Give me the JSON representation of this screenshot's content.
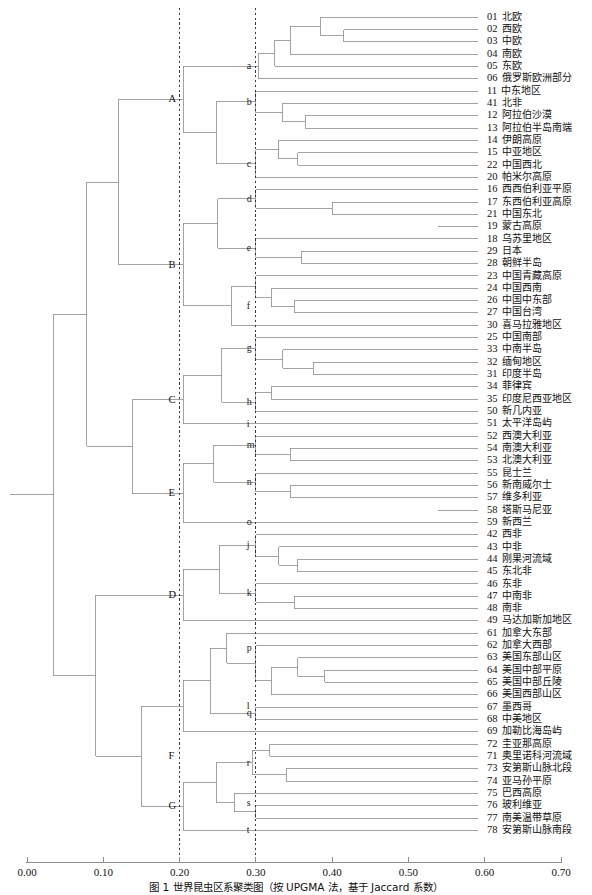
{
  "figure": {
    "caption": "图 1  世界昆虫区系聚类图（按 UPGMA 法，基于 Jaccard 系数）",
    "axis": {
      "label": "",
      "ticks": [
        "0.00",
        "0.10",
        "0.20",
        "0.30",
        "0.40",
        "0.50",
        "0.60",
        "0.70"
      ],
      "tick_values": [
        0.0,
        0.1,
        0.2,
        0.3,
        0.4,
        0.5,
        0.6,
        0.7
      ],
      "range": [
        0.0,
        0.7
      ],
      "reference_lines": [
        0.2,
        0.3
      ],
      "reference_line_style": "dashed"
    },
    "colors": {
      "line": "#8c8c8c",
      "text": "#111111",
      "axis": "#8c8c8c",
      "reference": "#222222",
      "background": "#ffffff"
    }
  },
  "chart_data": {
    "type": "dendrogram",
    "title": "世界昆虫区系聚类图",
    "xlabel": "",
    "ylabel": "",
    "xlim": [
      0.0,
      0.7
    ],
    "grid": false,
    "orientation": "horizontal-right-leaves",
    "leaves": [
      {
        "code": "01",
        "name": "北欧"
      },
      {
        "code": "02",
        "name": "西欧"
      },
      {
        "code": "03",
        "name": "中欧"
      },
      {
        "code": "04",
        "name": "南欧"
      },
      {
        "code": "05",
        "name": "东欧"
      },
      {
        "code": "06",
        "name": "俄罗斯欧洲部分"
      },
      {
        "code": "11",
        "name": "中东地区"
      },
      {
        "code": "41",
        "name": "北非"
      },
      {
        "code": "12",
        "name": "阿拉伯沙漠"
      },
      {
        "code": "13",
        "name": "阿拉伯半岛南端"
      },
      {
        "code": "14",
        "name": "伊朗高原"
      },
      {
        "code": "15",
        "name": "中亚地区"
      },
      {
        "code": "22",
        "name": "中国西北"
      },
      {
        "code": "20",
        "name": "帕米尔高原"
      },
      {
        "code": "16",
        "name": "西西伯利亚平原"
      },
      {
        "code": "17",
        "name": "东西伯利亚高原"
      },
      {
        "code": "21",
        "name": "中国东北"
      },
      {
        "code": "19",
        "name": "蒙古高原"
      },
      {
        "code": "18",
        "name": "乌苏里地区"
      },
      {
        "code": "29",
        "name": "日本"
      },
      {
        "code": "28",
        "name": "朝鲜半岛"
      },
      {
        "code": "23",
        "name": "中国青藏高原"
      },
      {
        "code": "24",
        "name": "中国西南"
      },
      {
        "code": "26",
        "name": "中国中东部"
      },
      {
        "code": "27",
        "name": "中国台湾"
      },
      {
        "code": "30",
        "name": "喜马拉雅地区"
      },
      {
        "code": "25",
        "name": "中国南部"
      },
      {
        "code": "33",
        "name": "中南半岛"
      },
      {
        "code": "32",
        "name": "缅甸地区"
      },
      {
        "code": "31",
        "name": "印度半岛"
      },
      {
        "code": "34",
        "name": "菲律宾"
      },
      {
        "code": "35",
        "name": "印度尼西亚地区"
      },
      {
        "code": "50",
        "name": "新几内亚"
      },
      {
        "code": "51",
        "name": "太平洋岛屿"
      },
      {
        "code": "52",
        "name": "西澳大利亚"
      },
      {
        "code": "54",
        "name": "南澳大利亚"
      },
      {
        "code": "53",
        "name": "北澳大利亚"
      },
      {
        "code": "55",
        "name": "昆士兰"
      },
      {
        "code": "56",
        "name": "新南威尔士"
      },
      {
        "code": "57",
        "name": "维多利亚"
      },
      {
        "code": "58",
        "name": "塔斯马尼亚"
      },
      {
        "code": "59",
        "name": "新西兰"
      },
      {
        "code": "42",
        "name": "西非"
      },
      {
        "code": "43",
        "name": "中非"
      },
      {
        "code": "44",
        "name": "刚果河流域"
      },
      {
        "code": "45",
        "name": "东北非"
      },
      {
        "code": "46",
        "name": "东非"
      },
      {
        "code": "47",
        "name": "中南非"
      },
      {
        "code": "48",
        "name": "南非"
      },
      {
        "code": "49",
        "name": "马达加斯加地区"
      },
      {
        "code": "61",
        "name": "加拿大东部"
      },
      {
        "code": "62",
        "name": "加拿大西部"
      },
      {
        "code": "63",
        "name": "美国东部山区"
      },
      {
        "code": "64",
        "name": "美国中部平原"
      },
      {
        "code": "65",
        "name": "美国中部丘陵"
      },
      {
        "code": "66",
        "name": "美国西部山区"
      },
      {
        "code": "67",
        "name": "墨西哥"
      },
      {
        "code": "68",
        "name": "中美地区"
      },
      {
        "code": "69",
        "name": "加勒比海岛屿"
      },
      {
        "code": "72",
        "name": "圭亚那高原"
      },
      {
        "code": "71",
        "name": "奥里诺科河流域"
      },
      {
        "code": "73",
        "name": "安第斯山脉北段"
      },
      {
        "code": "74",
        "name": "亚马孙平原"
      },
      {
        "code": "75",
        "name": "巴西高原"
      },
      {
        "code": "76",
        "name": "玻利维亚"
      },
      {
        "code": "77",
        "name": "南美温带草原"
      },
      {
        "code": "78",
        "name": "安第斯山脉南段"
      }
    ],
    "cluster_labels": [
      {
        "id": "A",
        "x": 0.2,
        "leaf_from": 0,
        "leaf_to": 13
      },
      {
        "id": "B",
        "x": 0.2,
        "leaf_from": 14,
        "leaf_to": 25
      },
      {
        "id": "C",
        "x": 0.2,
        "leaf_from": 26,
        "leaf_to": 33
      },
      {
        "id": "E",
        "x": 0.2,
        "leaf_from": 34,
        "leaf_to": 41
      },
      {
        "id": "D",
        "x": 0.2,
        "leaf_from": 42,
        "leaf_to": 49
      },
      {
        "id": "F",
        "x": 0.2,
        "leaf_from": 50,
        "leaf_to": 58
      },
      {
        "id": "G",
        "x": 0.2,
        "leaf_from": 59,
        "leaf_to": 66
      }
    ],
    "sub_labels": [
      {
        "id": "a",
        "x": 0.3
      },
      {
        "id": "b",
        "x": 0.3
      },
      {
        "id": "c",
        "x": 0.3
      },
      {
        "id": "d",
        "x": 0.3
      },
      {
        "id": "e",
        "x": 0.3
      },
      {
        "id": "f",
        "x": 0.3
      },
      {
        "id": "g",
        "x": 0.3
      },
      {
        "id": "h",
        "x": 0.3
      },
      {
        "id": "i",
        "x": 0.3
      },
      {
        "id": "m",
        "x": 0.3
      },
      {
        "id": "n",
        "x": 0.3
      },
      {
        "id": "o",
        "x": 0.3
      },
      {
        "id": "j",
        "x": 0.3
      },
      {
        "id": "k",
        "x": 0.3
      },
      {
        "id": "l",
        "x": 0.3
      },
      {
        "id": "p",
        "x": 0.3
      },
      {
        "id": "q",
        "x": 0.3
      },
      {
        "id": "r",
        "x": 0.3
      },
      {
        "id": "s",
        "x": 0.3
      },
      {
        "id": "t",
        "x": 0.3
      }
    ],
    "merges": [
      {
        "id": "m02_03",
        "children": [
          "leaf:02",
          "leaf:03"
        ],
        "height": 0.415
      },
      {
        "id": "m01_x",
        "children": [
          "leaf:01",
          "m02_03"
        ],
        "height": 0.385
      },
      {
        "id": "m04_x",
        "children": [
          "leaf:04",
          "m01_x"
        ],
        "height": 0.345
      },
      {
        "id": "m05_x",
        "children": [
          "leaf:05",
          "m04_x"
        ],
        "height": 0.325
      },
      {
        "id": "ma",
        "children": [
          "leaf:06",
          "m05_x"
        ],
        "height": 0.303
      },
      {
        "id": "m12_13",
        "children": [
          "leaf:12",
          "leaf:13"
        ],
        "height": 0.365
      },
      {
        "id": "m41_x",
        "children": [
          "leaf:41",
          "m12_13"
        ],
        "height": 0.335
      },
      {
        "id": "mb",
        "children": [
          "leaf:11",
          "m41_x"
        ],
        "height": 0.3
      },
      {
        "id": "m15_22",
        "children": [
          "leaf:15",
          "leaf:22"
        ],
        "height": 0.355
      },
      {
        "id": "m14_x",
        "children": [
          "leaf:14",
          "m15_22"
        ],
        "height": 0.33
      },
      {
        "id": "mc",
        "children": [
          "m14_x",
          "leaf:20"
        ],
        "height": 0.3
      },
      {
        "id": "mbc",
        "children": [
          "mb",
          "mc"
        ],
        "height": 0.248
      },
      {
        "id": "mA",
        "children": [
          "ma",
          "mbc"
        ],
        "height": 0.205
      },
      {
        "id": "m17_21",
        "children": [
          "leaf:17",
          "leaf:21"
        ],
        "height": 0.4
      },
      {
        "id": "md",
        "children": [
          "leaf:16",
          "m17_21"
        ],
        "height": 0.3
      },
      {
        "id": "m29_28",
        "children": [
          "leaf:29",
          "leaf:28"
        ],
        "height": 0.36
      },
      {
        "id": "me",
        "children": [
          "leaf:18",
          "m29_28"
        ],
        "height": 0.3
      },
      {
        "id": "mde",
        "children": [
          "md",
          "me"
        ],
        "height": 0.25
      },
      {
        "id": "m26_27",
        "children": [
          "leaf:26",
          "leaf:27"
        ],
        "height": 0.35
      },
      {
        "id": "m24_x",
        "children": [
          "leaf:24",
          "m26_27"
        ],
        "height": 0.32
      },
      {
        "id": "m23_x",
        "children": [
          "leaf:23",
          "m24_x"
        ],
        "height": 0.3
      },
      {
        "id": "mf",
        "children": [
          "m23_x",
          "leaf:30"
        ],
        "height": 0.268
      },
      {
        "id": "mB",
        "children": [
          "mde",
          "mf"
        ],
        "height": 0.205
      },
      {
        "id": "m32_31",
        "children": [
          "leaf:32",
          "leaf:31"
        ],
        "height": 0.375
      },
      {
        "id": "m33_x",
        "children": [
          "leaf:33",
          "m32_31"
        ],
        "height": 0.335
      },
      {
        "id": "mg",
        "children": [
          "leaf:25",
          "m33_x"
        ],
        "height": 0.3
      },
      {
        "id": "m34_35",
        "children": [
          "leaf:34",
          "leaf:35"
        ],
        "height": 0.32
      },
      {
        "id": "mh",
        "children": [
          "m34_35",
          "leaf:50"
        ],
        "height": 0.3
      },
      {
        "id": "mgh",
        "children": [
          "mg",
          "mh"
        ],
        "height": 0.255
      },
      {
        "id": "mC",
        "children": [
          "mgh",
          "leaf:51"
        ],
        "height": 0.205
      },
      {
        "id": "m54_53",
        "children": [
          "leaf:54",
          "leaf:53"
        ],
        "height": 0.345
      },
      {
        "id": "mm",
        "children": [
          "leaf:52",
          "m54_53"
        ],
        "height": 0.3
      },
      {
        "id": "m56_57",
        "children": [
          "leaf:56",
          "leaf:57"
        ],
        "height": 0.345
      },
      {
        "id": "mn",
        "children": [
          "leaf:55",
          "m56_57"
        ],
        "height": 0.3
      },
      {
        "id": "mmn",
        "children": [
          "mm",
          "mn"
        ],
        "height": 0.245
      },
      {
        "id": "mE",
        "children": [
          "mmn",
          "leaf:59"
        ],
        "height": 0.205
      },
      {
        "id": "m44_45",
        "children": [
          "leaf:44",
          "leaf:45"
        ],
        "height": 0.355
      },
      {
        "id": "m43_x",
        "children": [
          "leaf:43",
          "m44_45"
        ],
        "height": 0.33
      },
      {
        "id": "mj",
        "children": [
          "leaf:42",
          "m43_x"
        ],
        "height": 0.3
      },
      {
        "id": "m47_48",
        "children": [
          "leaf:47",
          "leaf:48"
        ],
        "height": 0.35
      },
      {
        "id": "mk",
        "children": [
          "leaf:46",
          "m47_48"
        ],
        "height": 0.3
      },
      {
        "id": "mjk",
        "children": [
          "mj",
          "mk"
        ],
        "height": 0.252
      },
      {
        "id": "mD",
        "children": [
          "mjk",
          "leaf:49"
        ],
        "height": 0.205
      },
      {
        "id": "m64_65",
        "children": [
          "leaf:64",
          "leaf:65"
        ],
        "height": 0.39
      },
      {
        "id": "m63_x",
        "children": [
          "leaf:63",
          "m64_65"
        ],
        "height": 0.355
      },
      {
        "id": "m66_x",
        "children": [
          "m63_x",
          "leaf:66"
        ],
        "height": 0.32
      },
      {
        "id": "m62_x",
        "children": [
          "leaf:62",
          "m66_x"
        ],
        "height": 0.3
      },
      {
        "id": "mp",
        "children": [
          "leaf:61",
          "m62_x"
        ],
        "height": 0.262
      },
      {
        "id": "mq",
        "children": [
          "leaf:67",
          "leaf:68"
        ],
        "height": 0.3
      },
      {
        "id": "mpq",
        "children": [
          "mp",
          "mq"
        ],
        "height": 0.24
      },
      {
        "id": "ml",
        "children": [
          "mpq",
          "leaf:69"
        ],
        "height": 0.205
      },
      {
        "id": "m73_74",
        "children": [
          "leaf:73",
          "leaf:74"
        ],
        "height": 0.34
      },
      {
        "id": "m72_71",
        "children": [
          "leaf:72",
          "leaf:71"
        ],
        "height": 0.318
      },
      {
        "id": "mr",
        "children": [
          "m72_71",
          "m73_74"
        ],
        "height": 0.295
      },
      {
        "id": "m76_77",
        "children": [
          "leaf:76",
          "leaf:77"
        ],
        "height": 0.3
      },
      {
        "id": "ms",
        "children": [
          "leaf:75",
          "m76_77"
        ],
        "height": 0.272
      },
      {
        "id": "mrs",
        "children": [
          "mr",
          "ms"
        ],
        "height": 0.248
      },
      {
        "id": "mG",
        "children": [
          "mrs",
          "leaf:78"
        ],
        "height": 0.205
      },
      {
        "id": "mF",
        "children": [
          "ml",
          "mG"
        ],
        "height": 0.15
      },
      {
        "id": "mDF",
        "children": [
          "mD",
          "mF"
        ],
        "height": 0.09
      },
      {
        "id": "mCE",
        "children": [
          "mC",
          "mE"
        ],
        "height": 0.138
      },
      {
        "id": "mAB",
        "children": [
          "mA",
          "mB"
        ],
        "height": 0.12
      },
      {
        "id": "mABCE",
        "children": [
          "mAB",
          "mCE"
        ],
        "height": 0.078
      },
      {
        "id": "root",
        "children": [
          "mABCE",
          "mDF"
        ],
        "height": 0.035
      }
    ]
  }
}
